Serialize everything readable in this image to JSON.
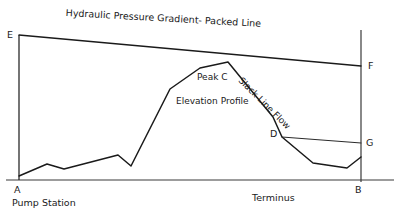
{
  "figure": {
    "title": "Hydraulic Pressure Gradient- Packed Line",
    "type": "engineering-line-diagram",
    "background_color": "#ffffff",
    "line_color": "#1a1a1a"
  },
  "labels": {
    "point_e": "E",
    "point_f": "F",
    "point_g": "G",
    "point_a": "A",
    "point_b": "B",
    "point_d": "D",
    "peak_c": "Peak C",
    "elevation_profile": "Elevation Profile",
    "slack_line_flow": "Slack Line Flow",
    "pump_station": "Pump Station",
    "terminus": "Terminus"
  },
  "chart_data": {
    "type": "line",
    "title": "Hydraulic Pressure Gradient- Packed Line",
    "xlabel": "",
    "ylabel": "",
    "xlim": [
      0,
      400
    ],
    "ylim": [
      218,
      0
    ],
    "grid": false,
    "legend": "none",
    "annotations": [
      {
        "name": "E",
        "x": 18,
        "y": 34,
        "note": "top of pump station pressure head"
      },
      {
        "name": "F",
        "x": 368,
        "y": 66,
        "note": "terminus packed-line head"
      },
      {
        "name": "G",
        "x": 366,
        "y": 143,
        "note": "terminus slack-line head"
      },
      {
        "name": "D",
        "x": 272,
        "y": 134,
        "note": "slack line break point"
      },
      {
        "name": "Peak C",
        "x": 196,
        "y": 78,
        "note": "summit of elevation profile"
      },
      {
        "name": "A",
        "x": 16,
        "y": 190,
        "note": "pump station station marker"
      },
      {
        "name": "B",
        "x": 357,
        "y": 190,
        "note": "terminus station marker"
      },
      {
        "name": "Elevation Profile",
        "x": 176,
        "y": 101
      },
      {
        "name": "Slack Line Flow",
        "x": 243,
        "y": 81
      },
      {
        "name": "Pump Station",
        "x": 12,
        "y": 202
      },
      {
        "name": "Terminus",
        "x": 252,
        "y": 197
      }
    ],
    "series": [
      {
        "name": "Hydraulic Pressure Gradient- Packed Line",
        "points": [
          [
            19,
            35
          ],
          [
            361,
            66
          ]
        ]
      },
      {
        "name": "Elevation Profile",
        "points": [
          [
            19,
            176
          ],
          [
            47,
            164
          ],
          [
            64,
            169
          ],
          [
            118,
            155
          ],
          [
            131,
            166
          ],
          [
            170,
            89
          ],
          [
            200,
            68
          ],
          [
            228,
            62
          ],
          [
            273,
            117
          ],
          [
            282,
            137
          ],
          [
            313,
            163
          ],
          [
            347,
            168
          ],
          [
            361,
            157
          ]
        ]
      },
      {
        "name": "Slack Line Gradient D-G",
        "points": [
          [
            282,
            137
          ],
          [
            361,
            143
          ]
        ]
      },
      {
        "name": "Pump Station Vertical A-E",
        "points": [
          [
            19,
            35
          ],
          [
            19,
            180
          ]
        ]
      },
      {
        "name": "Terminus Vertical B-F",
        "points": [
          [
            361,
            30
          ],
          [
            361,
            182
          ]
        ]
      },
      {
        "name": "Ground Baseline",
        "points": [
          [
            6,
            180
          ],
          [
            394,
            180
          ]
        ]
      }
    ]
  }
}
